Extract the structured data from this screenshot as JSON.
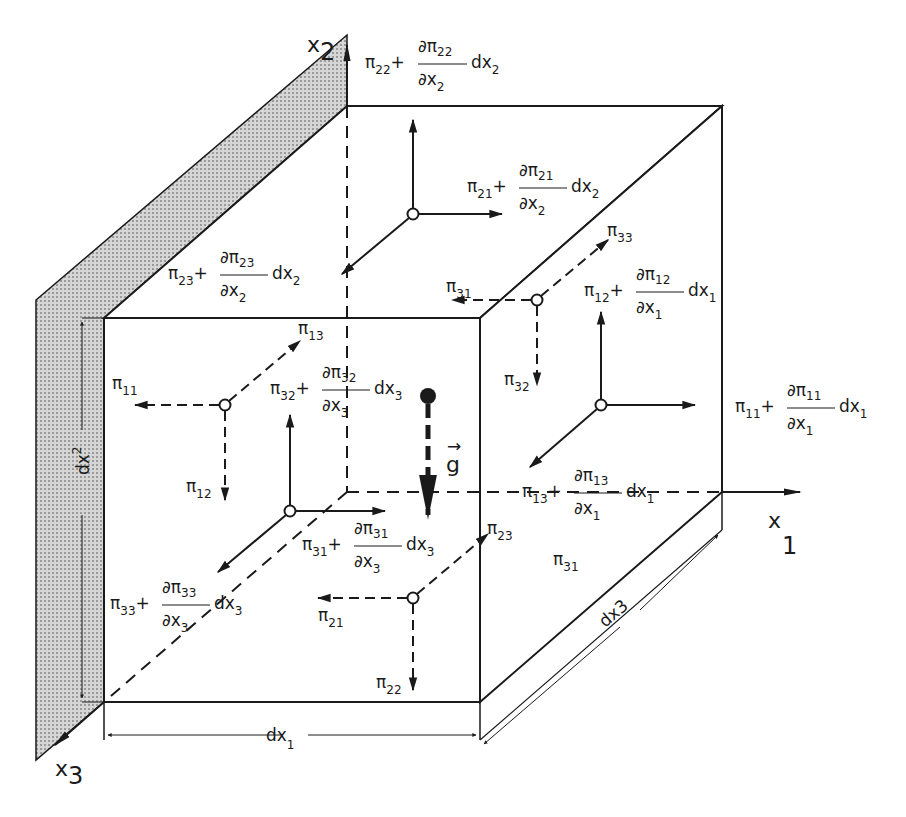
{
  "figure": {
    "colors": {
      "ink": "#1a1a1a",
      "wall_fill": "#bdbdbd",
      "background": "#ffffff"
    }
  },
  "axes": {
    "x1": {
      "base": "x",
      "index": "1"
    },
    "x2": {
      "base": "x",
      "index": "2"
    },
    "x3": {
      "base": "x",
      "index": "3"
    }
  },
  "dimensions": {
    "dx1": {
      "base": "dx",
      "index": "1"
    },
    "dx2": {
      "base": "dx",
      "index": "2"
    },
    "dx3": "dx3"
  },
  "gravity": {
    "symbol": "g",
    "arrow": "→"
  },
  "labels": {
    "pi11": {
      "sym": "π",
      "idx": "11"
    },
    "pi12": {
      "sym": "π",
      "idx": "12"
    },
    "pi13": {
      "sym": "π",
      "idx": "13"
    },
    "pi21": {
      "sym": "π",
      "idx": "21"
    },
    "pi22": {
      "sym": "π",
      "idx": "22"
    },
    "pi23": {
      "sym": "π",
      "idx": "23"
    },
    "pi31_back": {
      "sym": "π",
      "idx": "31"
    },
    "pi31_right": {
      "sym": "π",
      "idx": "31"
    },
    "pi32": {
      "sym": "π",
      "idx": "32"
    },
    "pi33": {
      "sym": "π",
      "idx": "33"
    }
  },
  "expressions": {
    "e22": {
      "sym": "π",
      "idx": "22",
      "plus": "+",
      "num": "∂π",
      "numidx": "22",
      "den": "∂x",
      "denidx": "2",
      "d": "dx",
      "didx": "2"
    },
    "e21": {
      "sym": "π",
      "idx": "21",
      "plus": "+",
      "num": "∂π",
      "numidx": "21",
      "den": "∂x",
      "denidx": "2",
      "d": "dx",
      "didx": "2"
    },
    "e23": {
      "sym": "π",
      "idx": "23",
      "plus": "+",
      "num": "∂π",
      "numidx": "23",
      "den": "∂x",
      "denidx": "2",
      "d": "dx",
      "didx": "2"
    },
    "e12": {
      "sym": "π",
      "idx": "12",
      "plus": "+",
      "num": "∂π",
      "numidx": "12",
      "den": "∂x",
      "denidx": "1",
      "d": "dx",
      "didx": "1"
    },
    "e11": {
      "sym": "π",
      "idx": "11",
      "plus": "+",
      "num": "∂π",
      "numidx": "11",
      "den": "∂x",
      "denidx": "1",
      "d": "dx",
      "didx": "1"
    },
    "e32": {
      "sym": "π",
      "idx": "32",
      "plus": "+",
      "num": "∂π",
      "numidx": "32",
      "den": "∂x",
      "denidx": "3",
      "d": "dx",
      "didx": "3"
    },
    "e13": {
      "sym": "π",
      "idx": "13",
      "plus": "+",
      "num": "∂π",
      "numidx": "13",
      "den": "∂x",
      "denidx": "1",
      "d": "dx",
      "didx": "1"
    },
    "e31": {
      "sym": "π",
      "idx": "31",
      "plus": "+",
      "num": "∂π",
      "numidx": "31",
      "den": "∂x",
      "denidx": "3",
      "d": "dx",
      "didx": "3"
    },
    "e33": {
      "sym": "π",
      "idx": "33",
      "plus": "+",
      "num": "∂π",
      "numidx": "33",
      "den": "∂x",
      "denidx": "3",
      "d": "dx",
      "didx": "3"
    }
  }
}
